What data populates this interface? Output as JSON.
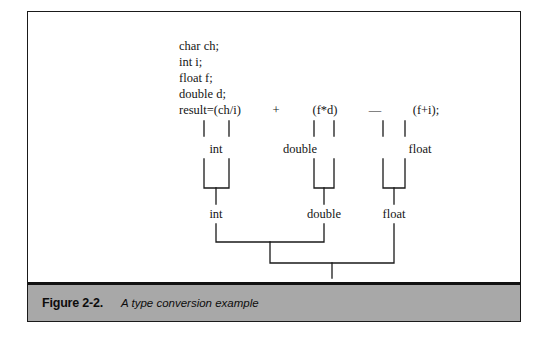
{
  "figure": {
    "caption_label": "Figure 2-2.",
    "caption_description": "A type conversion example",
    "frame_color": "#1a1a1a",
    "caption_band_color": "#a8a8a8",
    "background_color": "#ffffff",
    "line_color": "#1a1a1a"
  },
  "code": {
    "lines": [
      "char ch;",
      "int i;",
      "float f;",
      "double d;"
    ],
    "expression_prefix": "result=(ch/i)",
    "operand_2": "(f*d)",
    "operand_3": "(f+i);",
    "operator_1": "+",
    "operator_2": "—"
  },
  "conversion_tree": {
    "level_1": [
      {
        "label": "int"
      },
      {
        "label": "double"
      },
      {
        "label": "float"
      }
    ],
    "level_2": [
      {
        "label": "int"
      },
      {
        "label": "double"
      },
      {
        "label": "float"
      }
    ],
    "level_3": [
      {
        "label": "double"
      }
    ]
  }
}
